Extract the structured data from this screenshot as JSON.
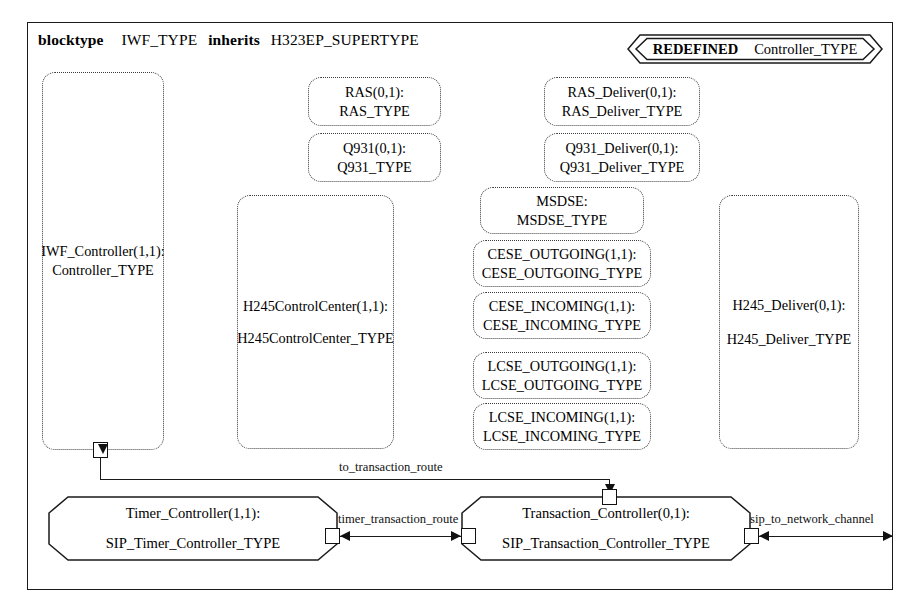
{
  "diagram": {
    "header": {
      "kw1": "blocktype",
      "name": "IWF_TYPE",
      "kw2": "inherits",
      "supertype": "H323EP_SUPERTYPE"
    },
    "redefined_badge": {
      "keyword": "REDEFINED",
      "value": "Controller_TYPE"
    },
    "components": [
      {
        "id": "iwf-controller",
        "line1": "IWF_Controller(1,1):",
        "line2": "Controller_TYPE"
      },
      {
        "id": "ras",
        "line1": "RAS(0,1):",
        "line2": "RAS_TYPE"
      },
      {
        "id": "q931",
        "line1": "Q931(0,1):",
        "line2": "Q931_TYPE"
      },
      {
        "id": "ras-deliver",
        "line1": "RAS_Deliver(0,1):",
        "line2": "RAS_Deliver_TYPE"
      },
      {
        "id": "q931-deliver",
        "line1": "Q931_Deliver(0,1):",
        "line2": "Q931_Deliver_TYPE"
      },
      {
        "id": "h245controlcenter",
        "line1": "H245ControlCenter(1,1):",
        "line2": "H245ControlCenter_TYPE"
      },
      {
        "id": "msdse",
        "line1": "MSDSE:",
        "line2": "MSDSE_TYPE"
      },
      {
        "id": "cese-outgoing",
        "line1": "CESE_OUTGOING(1,1):",
        "line2": "CESE_OUTGOING_TYPE"
      },
      {
        "id": "cese-incoming",
        "line1": "CESE_INCOMING(1,1):",
        "line2": "CESE_INCOMING_TYPE"
      },
      {
        "id": "lcse-outgoing",
        "line1": "LCSE_OUTGOING(1,1):",
        "line2": "LCSE_OUTGOING_TYPE"
      },
      {
        "id": "lcse-incoming",
        "line1": "LCSE_INCOMING(1,1):",
        "line2": "LCSE_INCOMING_TYPE"
      },
      {
        "id": "h245-deliver",
        "line1": "H245_Deliver(0,1):",
        "line2": "H245_Deliver_TYPE"
      }
    ],
    "controllers": [
      {
        "id": "timer-controller",
        "line1": "Timer_Controller(1,1):",
        "line2": "SIP_Timer_Controller_TYPE"
      },
      {
        "id": "transaction-controller",
        "line1": "Transaction_Controller(0,1):",
        "line2": "SIP_Transaction_Controller_TYPE"
      }
    ],
    "channels": [
      {
        "id": "to-transaction-route",
        "label": "to_transaction_route"
      },
      {
        "id": "timer-transaction-route",
        "label": "timer_transaction_route"
      },
      {
        "id": "sip-to-network-channel",
        "label": "sip_to_network_channel"
      }
    ],
    "colors": {
      "line": "#1a1a1a",
      "dotted": "#3b3b3b",
      "background": "#ffffff"
    }
  }
}
